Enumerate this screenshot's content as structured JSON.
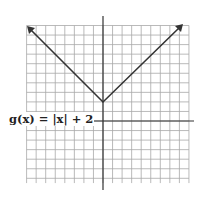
{
  "chart_data": {
    "type": "line",
    "title": "",
    "function_label": "g(x) = |x| + 2",
    "xlabel": "",
    "ylabel": "",
    "grid": true,
    "xlim": [
      -8,
      9
    ],
    "ylim": [
      -6.5,
      10
    ],
    "vertex": [
      0,
      2
    ],
    "series": [
      {
        "name": "g(x) = |x| + 2",
        "x": [
          -8,
          0,
          8
        ],
        "values": [
          10,
          2,
          10
        ]
      }
    ],
    "arrows": "both ends"
  },
  "label": {
    "text": "g(x) = |x| + 2"
  },
  "colors": {
    "grid": "#9a9a9a",
    "axis": "#333333",
    "line": "#333333"
  }
}
